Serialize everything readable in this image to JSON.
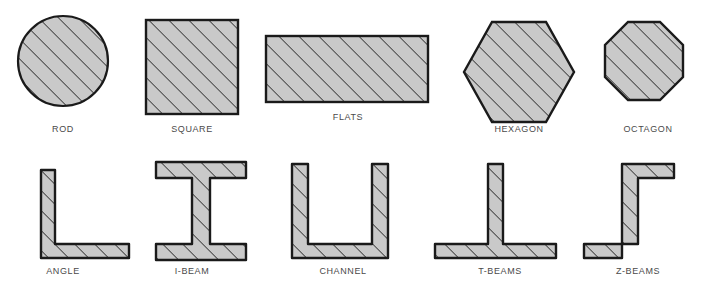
{
  "figure": {
    "width": 706,
    "height": 289,
    "background_color": "#ffffff",
    "fill_color": "#c9c9c9",
    "outline_color": "#1a1a1a",
    "hatch_color": "#2b2b2b",
    "label_color": "#4a4a4a",
    "hatch_angle_degrees": 45,
    "hatch_spacing_px": 10
  },
  "rows": [
    {
      "name": "bar-stock-row",
      "shapes": [
        {
          "id": "rod",
          "label": "ROD",
          "geometry": "circle",
          "x": 18,
          "y": 16,
          "width": 90,
          "height": 90,
          "label_y": 124
        },
        {
          "id": "square",
          "label": "SQUARE",
          "geometry": "square",
          "x": 146,
          "y": 20,
          "width": 92,
          "height": 94,
          "label_y": 124
        },
        {
          "id": "flats",
          "label": "FLATS",
          "geometry": "rectangle",
          "x": 266,
          "y": 36,
          "width": 162,
          "height": 66,
          "label_y": 112
        },
        {
          "id": "hexagon",
          "label": "HEXAGON",
          "geometry": "hexagon",
          "x": 464,
          "y": 22,
          "width": 110,
          "height": 100,
          "label_y": 124
        },
        {
          "id": "octagon",
          "label": "OCTAGON",
          "geometry": "octagon",
          "x": 600,
          "y": 22,
          "width": 98,
          "height": 98,
          "label_y": 124
        }
      ]
    },
    {
      "name": "structural-shapes-row",
      "shapes": [
        {
          "id": "angle",
          "label": "ANGLE",
          "geometry": "angle-L",
          "x": 40,
          "y": 162,
          "width": 94,
          "height": 98,
          "label_y": 266
        },
        {
          "id": "i-beam",
          "label": "I-BEAM",
          "geometry": "i-beam",
          "x": 156,
          "y": 160,
          "width": 92,
          "height": 100,
          "label_y": 266
        },
        {
          "id": "channel",
          "label": "CHANNEL",
          "geometry": "channel-U",
          "x": 290,
          "y": 162,
          "width": 100,
          "height": 98,
          "label_y": 266
        },
        {
          "id": "t-beams",
          "label": "T-BEAMS",
          "geometry": "tee",
          "x": 433,
          "y": 162,
          "width": 124,
          "height": 98,
          "label_y": 266
        },
        {
          "id": "z-beams",
          "label": "Z-BEAMS",
          "geometry": "zee",
          "x": 581,
          "y": 162,
          "width": 94,
          "height": 98,
          "label_y": 266
        }
      ]
    }
  ]
}
